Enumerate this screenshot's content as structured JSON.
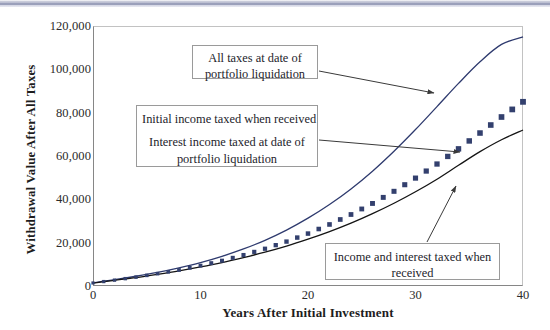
{
  "chart_data": {
    "type": "line",
    "title": "",
    "xlabel": "Years After Initial Investment",
    "ylabel": "Withdrawal Value After All Taxes",
    "xlim": [
      0,
      40
    ],
    "ylim": [
      0,
      120000
    ],
    "grid": false,
    "legend": "none",
    "xticks": [
      "0",
      "10",
      "20",
      "30",
      "40"
    ],
    "xtick_values": [
      0,
      10,
      20,
      30,
      40
    ],
    "yticks": [
      "0",
      "20,000",
      "40,000",
      "60,000",
      "80,000",
      "100,000",
      "120,000"
    ],
    "ytick_values": [
      0,
      20000,
      40000,
      60000,
      80000,
      100000,
      120000
    ],
    "x": [
      0,
      2,
      4,
      6,
      8,
      10,
      12,
      14,
      16,
      18,
      20,
      22,
      24,
      26,
      28,
      30,
      32,
      34,
      36,
      38,
      40
    ],
    "series": [
      {
        "name": "All taxes at date of portfolio liquidation",
        "style": "line",
        "color": "#2e3a6e",
        "values": [
          1500,
          2900,
          4500,
          6300,
          8400,
          10800,
          13700,
          17100,
          21100,
          25800,
          31300,
          37600,
          44800,
          53000,
          62200,
          72200,
          82800,
          93500,
          103500,
          111500,
          115000
        ]
      },
      {
        "name": "Initial income taxed when received; Interest income taxed at date of portfolio liquidation",
        "style": "markers",
        "marker": "square",
        "color": "#33406e",
        "values": [
          1400,
          2700,
          4100,
          5700,
          7400,
          9400,
          11700,
          14300,
          17200,
          20500,
          24200,
          28400,
          33000,
          38100,
          43700,
          49800,
          56300,
          63300,
          70600,
          78000,
          85000
        ]
      },
      {
        "name": "Income and interest taxed when received",
        "style": "line",
        "color": "#141414",
        "values": [
          1300,
          2600,
          3900,
          5400,
          7000,
          8800,
          10800,
          13100,
          15600,
          18400,
          21600,
          25100,
          29000,
          33400,
          38200,
          43500,
          49300,
          55700,
          62000,
          67500,
          72000
        ]
      }
    ],
    "annotations": [
      {
        "id": "callout-all-taxes",
        "lines": [
          "All taxes at date of",
          "portfolio liquidation"
        ],
        "points_to": "top-curve"
      },
      {
        "id": "callout-initial-income",
        "lines": [
          "Initial income taxed when received",
          "Interest income taxed at date of",
          "portfolio liquidation"
        ],
        "points_to": "square-markers"
      },
      {
        "id": "callout-income-and-interest",
        "lines": [
          "Income and interest taxed when",
          "received"
        ],
        "points_to": "bottom-curve"
      }
    ]
  }
}
